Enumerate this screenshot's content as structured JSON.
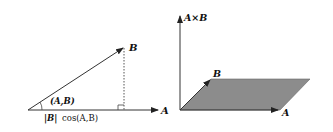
{
  "left_diagram": {
    "vector_a_label": "A",
    "vector_b_label": "B",
    "angle_label": "(A,B)",
    "projection_label_abs": "|B|",
    "projection_label_cos": "cos(A,B)"
  },
  "right_diagram": {
    "cross_product_label": "A×B",
    "vector_a_label": "A",
    "vector_b_label": "B",
    "parallelogram_color": "#8c8c8c"
  }
}
